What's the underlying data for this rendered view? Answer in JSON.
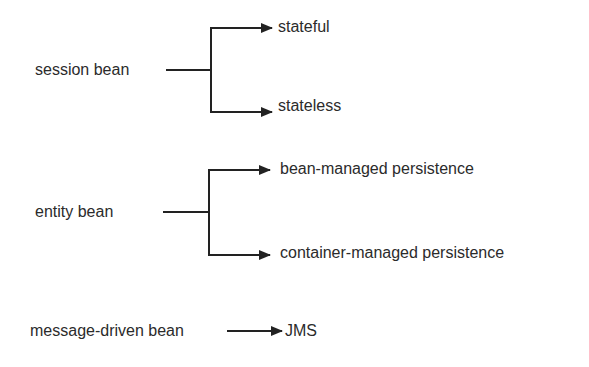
{
  "diagram": {
    "groups": [
      {
        "source": "session bean",
        "targets": [
          "stateful",
          "stateless"
        ]
      },
      {
        "source": "entity bean",
        "targets": [
          "bean-managed persistence",
          "container-managed persistence"
        ]
      },
      {
        "source": "message-driven bean",
        "targets": [
          "JMS"
        ]
      }
    ],
    "colors": {
      "line": "#222222",
      "text": "#2b2b2b",
      "background": "#ffffff"
    }
  }
}
